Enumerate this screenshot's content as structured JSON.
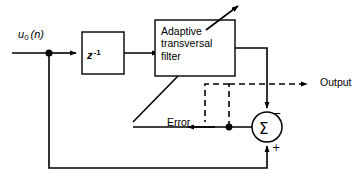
{
  "diagram": {
    "type": "block-diagram",
    "blocks": [
      {
        "id": "delay",
        "label": "z",
        "exponent": "-1",
        "shape": "rectangle"
      },
      {
        "id": "filter",
        "label_line1": "Adaptive",
        "label_line2": "transversal",
        "label_line3": "filter",
        "shape": "rectangle"
      },
      {
        "id": "summer",
        "label": "Σ",
        "shape": "circle",
        "input_sign_top": "−",
        "input_sign_bottom": "+"
      }
    ],
    "signals": {
      "input_base": "u",
      "input_subscript": "0",
      "input_arg": "(n)",
      "error": "Error",
      "output": "Output"
    },
    "colors": {
      "stroke": "#000000",
      "background": "#ffffff"
    }
  }
}
